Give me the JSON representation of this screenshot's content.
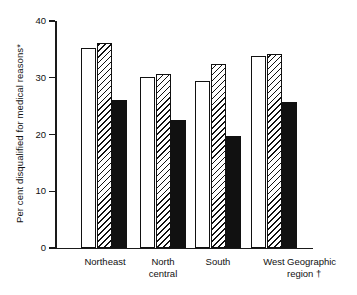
{
  "chart_data": {
    "type": "bar",
    "title": "",
    "subtitle": "",
    "xlabel": "Geographic\nregion †",
    "ylabel": "Per cent disqualified for medical reasons*",
    "categories": [
      "Northeast",
      "North\ncentral",
      "South",
      "West"
    ],
    "ylim": [
      0,
      40
    ],
    "yticks": [
      0,
      10,
      20,
      30,
      40
    ],
    "ytick_labels": [
      "0",
      "10",
      "20",
      "30",
      "40"
    ],
    "grid": false,
    "legend": "none",
    "legend_position": "none",
    "series": [
      {
        "name": "white-bar",
        "fill": "white",
        "values": [
          35.3,
          30.1,
          29.4,
          33.8
        ]
      },
      {
        "name": "hatched-bar",
        "fill": "diagonal-hatch",
        "values": [
          36.2,
          30.6,
          32.4,
          34.2
        ]
      },
      {
        "name": "black-bar",
        "fill": "solid-black",
        "values": [
          26.1,
          22.6,
          19.7,
          25.8
        ]
      }
    ],
    "annotations": [
      "*",
      "†"
    ],
    "colors": {
      "axis": "#111111",
      "bar_outline": "#111111",
      "bar_white_fill": "#ffffff",
      "bar_black_fill": "#111111",
      "background": "#ffffff"
    }
  }
}
